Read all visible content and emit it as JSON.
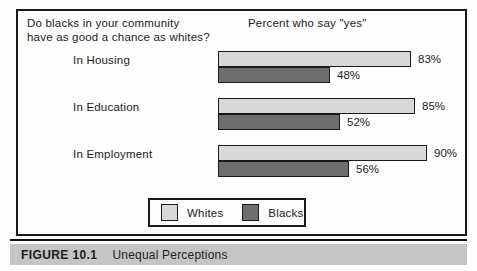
{
  "figure": {
    "question_line1": "Do blacks in your community",
    "question_line2": "have as good a chance as whites?",
    "subtitle": "Percent who say \"yes\""
  },
  "legend": {
    "whites": "Whites",
    "blacks": "Blacks"
  },
  "caption": {
    "number": "FIGURE 10.1",
    "title": "Unequal Perceptions"
  },
  "colors": {
    "whites_fill": "#d8d8d8",
    "blacks_fill": "#6e6e6e",
    "bar_border": "#1a1a1a",
    "caption_bg": "#c5c5c5"
  },
  "chart_data": {
    "type": "bar",
    "orientation": "horizontal",
    "title": "Do blacks in your community have as good a chance as whites?",
    "subtitle": "Percent who say \"yes\"",
    "categories": [
      "In Housing",
      "In Education",
      "In Employment"
    ],
    "series": [
      {
        "name": "Whites",
        "values": [
          83,
          85,
          90
        ]
      },
      {
        "name": "Blacks",
        "values": [
          48,
          52,
          56
        ]
      }
    ],
    "unit": "%",
    "xlim": [
      0,
      100
    ],
    "grid": false,
    "legend_position": "bottom",
    "value_labels": true
  }
}
